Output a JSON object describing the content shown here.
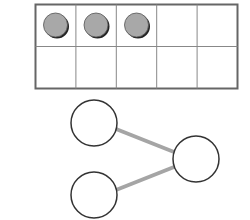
{
  "ten_frame": {
    "rows": 2,
    "cols": 5,
    "filled_counters": 3,
    "counter_color": "#a8a8a8",
    "counter_shadow": "#2a2a2a",
    "grid_color": "#777777"
  },
  "number_bond": {
    "line_color": "#a5a5a5",
    "circle_stroke": "#333333",
    "parts": [
      {
        "label": ""
      },
      {
        "label": ""
      }
    ],
    "whole": {
      "label": ""
    }
  }
}
